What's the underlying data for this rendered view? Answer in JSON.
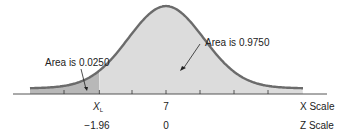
{
  "chart_data": {
    "type": "area",
    "title": "",
    "distribution": "normal",
    "mean_x": 7,
    "x_scale_label": "X Scale",
    "z_scale_label": "Z Scale",
    "x_ticks": [
      {
        "z": -1.96,
        "x_label": "X",
        "x_label_sub": "L",
        "z_label": "−1.96"
      },
      {
        "z": 0,
        "x_label": "7",
        "z_label": "0"
      }
    ],
    "z_range": [
      -4.5,
      4.5
    ],
    "minor_tick_z": [
      -3.0,
      -1.96,
      -1.0,
      0,
      1.0,
      2.0,
      3.0
    ],
    "shaded_regions": [
      {
        "name": "left-tail",
        "from_z": -4.5,
        "to_z": -1.96,
        "area": 0.025,
        "color": "#b8b8b8"
      },
      {
        "name": "body",
        "from_z": -1.96,
        "to_z": 4.5,
        "area": 0.975,
        "color": "#dcdcdc"
      }
    ],
    "annotations": [
      {
        "text": "Area is 0.0250",
        "points_to_z": -2.3
      },
      {
        "text": "Area is 0.9750",
        "points_to_z": 0.6
      }
    ],
    "curve_color": "#6b6b6b"
  }
}
